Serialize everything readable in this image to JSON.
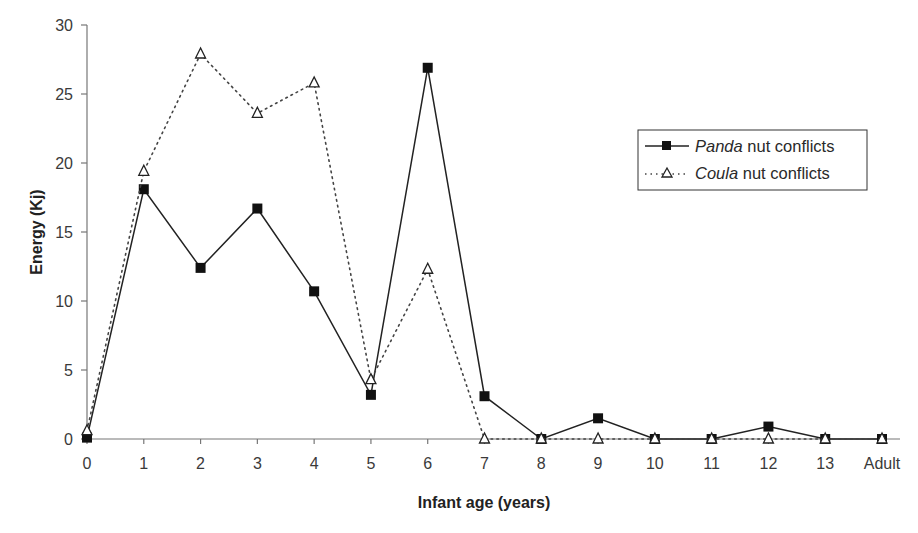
{
  "chart_data": {
    "type": "line",
    "title": "",
    "xlabel": "Infant age (years)",
    "ylabel": "Energy (Kj)",
    "ylim": [
      0,
      30
    ],
    "yticks": [
      0,
      5,
      10,
      15,
      20,
      25,
      30
    ],
    "grid": false,
    "legend_position": "upper right",
    "categories": [
      "0",
      "1",
      "2",
      "3",
      "4",
      "5",
      "6",
      "7",
      "8",
      "9",
      "10",
      "11",
      "12",
      "13",
      "Adult"
    ],
    "series": [
      {
        "name": "Panda nut conflicts",
        "name_italic": "Panda",
        "name_rest": " nut conflicts",
        "line": "solid",
        "marker": "filled-square",
        "color": "#222222",
        "values": [
          0.1,
          18.1,
          12.4,
          16.7,
          10.7,
          3.2,
          26.9,
          3.1,
          0,
          1.5,
          0,
          0,
          0.9,
          0,
          0
        ]
      },
      {
        "name": "Coula nut conflicts",
        "name_italic": "Coula",
        "name_rest": " nut conflicts",
        "line": "dotted",
        "marker": "open-triangle",
        "color": "#444444",
        "values": [
          0.6,
          19.4,
          27.9,
          23.6,
          25.8,
          4.3,
          12.3,
          0,
          0,
          0,
          0,
          0,
          0,
          0,
          0
        ]
      }
    ]
  }
}
